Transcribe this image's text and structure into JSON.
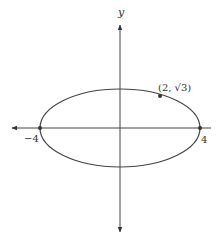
{
  "figure": {
    "type": "ellipse-graph",
    "axes": {
      "y_label": "y",
      "x_label": ""
    },
    "ellipse": {
      "equation_hint": "x^2/16 + y^2/4 = 1",
      "center": [
        0,
        0
      ],
      "semi_major": 4,
      "semi_minor": 2
    },
    "labels": {
      "left_vertex": "−4",
      "right_vertex": "4",
      "point": "(2, √3)"
    },
    "points": [
      {
        "name": "left-vertex",
        "x": -4,
        "y": 0
      },
      {
        "name": "right-vertex",
        "x": 4,
        "y": 0
      },
      {
        "name": "labeled-point",
        "x": 2,
        "y": 1.732
      }
    ],
    "colors": {
      "stroke": "#444444",
      "background": "#ffffff"
    }
  }
}
